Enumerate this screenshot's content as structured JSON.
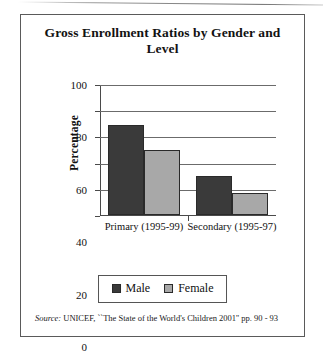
{
  "figure": {
    "title": "Gross Enrollment Ratios by Gender and Level",
    "source_label": "Source:",
    "source_text": "UNICEF, ``The State of the World's Children 2001'' pp. 90 - 93"
  },
  "chart_data": {
    "type": "bar",
    "title": "Gross Enrollment Ratios by Gender and Level",
    "xlabel": "",
    "ylabel": "Percentage",
    "categories": [
      "Primary (1995-99)",
      "Secondary (1995-97)"
    ],
    "series": [
      {
        "name": "Male",
        "color": "#3a3a3a",
        "values": [
          69,
          30
        ]
      },
      {
        "name": "Female",
        "color": "#a8a8a8",
        "values": [
          50,
          17
        ]
      }
    ],
    "ylim": [
      0,
      100
    ],
    "yticks": [
      0,
      20,
      40,
      60,
      80,
      100
    ],
    "ytick_labels": [
      "0",
      "20",
      "40",
      "60",
      "80",
      "100"
    ],
    "grid": true,
    "legend_position": "bottom"
  }
}
